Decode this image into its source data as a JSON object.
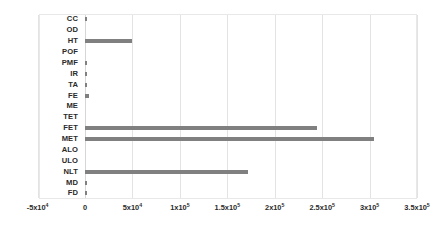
{
  "chart_data": {
    "type": "bar",
    "orientation": "horizontal",
    "title": "",
    "xlabel": "",
    "ylabel": "",
    "grid": true,
    "legend": false,
    "xlim": [
      -50000,
      350000
    ],
    "categories": [
      "CC",
      "OD",
      "HT",
      "POF",
      "PMF",
      "IR",
      "TA",
      "FE",
      "ME",
      "TET",
      "FET",
      "MET",
      "ALO",
      "ULO",
      "NLT",
      "MD",
      "FD"
    ],
    "values": [
      1200,
      0,
      50000,
      0,
      700,
      700,
      700,
      4000,
      0,
      0,
      245000,
      305000,
      0,
      0,
      172000,
      700,
      1500
    ],
    "xticks": [
      {
        "value": -50000,
        "label": "-5x10",
        "exponent": "4"
      },
      {
        "value": 0,
        "label": "0",
        "exponent": ""
      },
      {
        "value": 50000,
        "label": "5x10",
        "exponent": "4"
      },
      {
        "value": 100000,
        "label": "1x10",
        "exponent": "5"
      },
      {
        "value": 150000,
        "label": "1.5x10",
        "exponent": "5"
      },
      {
        "value": 200000,
        "label": "2x10",
        "exponent": "5"
      },
      {
        "value": 250000,
        "label": "2.5x10",
        "exponent": "5"
      },
      {
        "value": 300000,
        "label": "3x10",
        "exponent": "5"
      },
      {
        "value": 350000,
        "label": "3.5x10",
        "exponent": "5"
      }
    ],
    "bar_color": "#808080",
    "gridline_color": "#e3e3e3",
    "background_color": "#ffffff"
  }
}
